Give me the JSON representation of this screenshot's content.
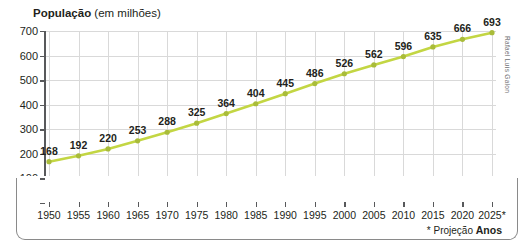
{
  "chart_data": {
    "type": "line",
    "title": "População (em milhões)",
    "title_bold": "População",
    "title_rest": " (em milhões)",
    "xlabel": "Anos",
    "ylabel": "",
    "categories": [
      "1950",
      "1955",
      "1960",
      "1965",
      "1970",
      "1975",
      "1980",
      "1985",
      "1990",
      "1995",
      "2000",
      "2005",
      "2010",
      "2015",
      "2020",
      "2025*"
    ],
    "values": [
      168,
      192,
      220,
      253,
      288,
      325,
      364,
      404,
      445,
      486,
      526,
      562,
      596,
      635,
      666,
      693
    ],
    "series": [
      {
        "name": "População",
        "values": [
          168,
          192,
          220,
          253,
          288,
          325,
          364,
          404,
          445,
          486,
          526,
          562,
          596,
          635,
          666,
          693
        ]
      }
    ],
    "ylim": [
      0,
      700
    ],
    "yticks": [
      0,
      100,
      200,
      300,
      400,
      500,
      600,
      700
    ],
    "ytick_labels": [
      "0",
      "100",
      "200",
      "300",
      "400",
      "500",
      "600",
      "700"
    ],
    "grid": true,
    "legend": "none",
    "line_color": "#c3d643",
    "marker_color": "#a9bc3a",
    "grid_color": "#d9d9d9",
    "axis_color": "#58595b",
    "text_color": "#231f20",
    "annotations": {
      "footnote_projection": "* Projeção",
      "axis_name": "Anos"
    }
  },
  "credit": "Rafael Luís Galon"
}
